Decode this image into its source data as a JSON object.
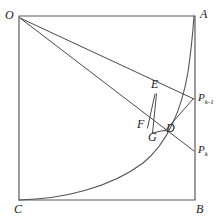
{
  "figure": {
    "type": "geometry-diagram",
    "stroke_color": "#4a4a4a",
    "background_color": "#ffffff",
    "width": 219,
    "height": 223
  },
  "labels": {
    "O": "O",
    "A": "A",
    "B": "B",
    "C": "C",
    "D": "D",
    "E": "E",
    "F": "F",
    "G": "G",
    "P_prev_base": "P",
    "P_prev_sub": "k-1",
    "P_curr_base": "P",
    "P_curr_sub": "k"
  },
  "geometry": {
    "square": {
      "left": 19,
      "top": 16,
      "right": 195,
      "bottom": 200
    },
    "points": {
      "O": [
        19,
        16
      ],
      "A": [
        195,
        16
      ],
      "B": [
        195,
        200
      ],
      "C": [
        19,
        200
      ],
      "P_prev": [
        194,
        99
      ],
      "P_curr": [
        194,
        151
      ],
      "E": [
        156,
        94
      ],
      "F": [
        148,
        127
      ],
      "G": [
        153,
        132
      ],
      "D": [
        166,
        131
      ]
    },
    "curve": {
      "from": "C",
      "to": "A",
      "shape": "exponential",
      "control_points": [
        [
          19,
          200
        ],
        [
          100,
          196
        ],
        [
          160,
          150
        ],
        [
          183,
          60
        ],
        [
          192,
          20
        ]
      ]
    },
    "rays": [
      {
        "from": "O",
        "to": "P_prev",
        "through": [
          "E"
        ]
      },
      {
        "from": "O",
        "to": "P_curr",
        "through": [
          "F",
          "G"
        ]
      }
    ],
    "segments": [
      {
        "from": "E",
        "to": "G"
      },
      {
        "from": "E",
        "to": "F"
      },
      {
        "from": "P_prev",
        "to": "D"
      },
      {
        "from": "D",
        "to": "G"
      }
    ]
  }
}
